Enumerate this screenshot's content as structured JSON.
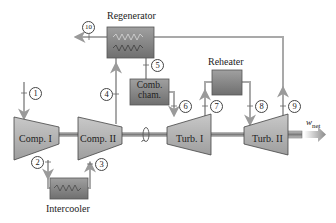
{
  "diagram": {
    "type": "gas-turbine cycle with intercooling, reheating and regeneration",
    "components": {
      "regenerator": "Regenerator",
      "combustion_chamber_line1": "Comb.",
      "combustion_chamber_line2": "cham.",
      "reheater": "Reheater",
      "compressor_1": "Comp. I",
      "compressor_2": "Comp. II",
      "turbine_1": "Turb. I",
      "turbine_2": "Turb. II",
      "intercooler": "Intercooler"
    },
    "states": [
      "1",
      "2",
      "3",
      "4",
      "5",
      "6",
      "7",
      "8",
      "9",
      "10"
    ],
    "output": {
      "symbol": "w",
      "subscript": "net"
    },
    "colors": {
      "flow_line": "#a9a9a9",
      "equipment_fill": "#8f8f8f",
      "equipment_dark": "#6e6e6e",
      "turbomachine_fill": "#b5b5b5",
      "shaft": "#9a9a9a",
      "text": "#222222"
    }
  }
}
